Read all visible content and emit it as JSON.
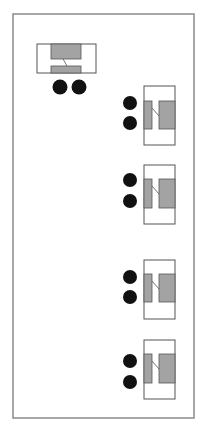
{
  "colors": {
    "background": "#ffffff",
    "frame": "#8a8a8a",
    "outline": "#555555",
    "pad_fill": "#a3a3a3",
    "dot_fill": "#111111"
  },
  "frame": {
    "x": 13,
    "y": 14,
    "w": 181,
    "h": 404
  },
  "components": [
    {
      "orientation": "horizontal",
      "body": {
        "x": 37,
        "y": 44,
        "w": 59,
        "h": 29
      },
      "pads": [
        {
          "x": 51,
          "y": 44,
          "w": 30,
          "h": 15
        },
        {
          "x": 51,
          "y": 66,
          "w": 30,
          "h": 7
        }
      ],
      "link": {
        "x1": 63,
        "y1": 59,
        "x2": 67,
        "y2": 66
      },
      "dots": [
        {
          "cx": 60,
          "cy": 87,
          "r": 7.5
        },
        {
          "cx": 79,
          "cy": 87,
          "r": 7.5
        }
      ]
    },
    {
      "orientation": "vertical",
      "body": {
        "x": 144,
        "y": 86,
        "w": 31,
        "h": 59
      },
      "pads": [
        {
          "x": 144,
          "y": 101,
          "w": 8,
          "h": 28
        },
        {
          "x": 159,
          "y": 101,
          "w": 16,
          "h": 28
        }
      ],
      "link": {
        "x1": 152,
        "y1": 108,
        "x2": 159,
        "y2": 116
      },
      "dots": [
        {
          "cx": 130,
          "cy": 103,
          "r": 7
        },
        {
          "cx": 130,
          "cy": 123,
          "r": 7
        }
      ]
    },
    {
      "orientation": "vertical",
      "body": {
        "x": 144,
        "y": 165,
        "w": 31,
        "h": 59
      },
      "pads": [
        {
          "x": 144,
          "y": 179,
          "w": 8,
          "h": 29
        },
        {
          "x": 159,
          "y": 179,
          "w": 16,
          "h": 29
        }
      ],
      "link": {
        "x1": 152,
        "y1": 186,
        "x2": 159,
        "y2": 194
      },
      "dots": [
        {
          "cx": 130,
          "cy": 180,
          "r": 7
        },
        {
          "cx": 130,
          "cy": 201,
          "r": 7
        }
      ]
    },
    {
      "orientation": "vertical",
      "body": {
        "x": 144,
        "y": 260,
        "w": 31,
        "h": 59
      },
      "pads": [
        {
          "x": 144,
          "y": 274,
          "w": 8,
          "h": 28
        },
        {
          "x": 159,
          "y": 274,
          "w": 16,
          "h": 28
        }
      ],
      "link": {
        "x1": 152,
        "y1": 281,
        "x2": 159,
        "y2": 289
      },
      "dots": [
        {
          "cx": 130,
          "cy": 277,
          "r": 7
        },
        {
          "cx": 130,
          "cy": 297,
          "r": 7
        }
      ]
    },
    {
      "orientation": "vertical",
      "body": {
        "x": 144,
        "y": 340,
        "w": 31,
        "h": 59
      },
      "pads": [
        {
          "x": 144,
          "y": 354,
          "w": 8,
          "h": 29
        },
        {
          "x": 159,
          "y": 354,
          "w": 16,
          "h": 29
        }
      ],
      "link": {
        "x1": 152,
        "y1": 361,
        "x2": 159,
        "y2": 369
      },
      "dots": [
        {
          "cx": 130,
          "cy": 361,
          "r": 7
        },
        {
          "cx": 130,
          "cy": 382,
          "r": 7
        }
      ]
    }
  ]
}
